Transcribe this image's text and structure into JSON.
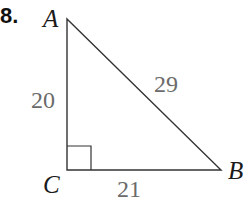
{
  "problem": {
    "number": "8."
  },
  "triangle": {
    "vertices": [
      {
        "label": "A",
        "x": 67,
        "y": 19
      },
      {
        "label": "B",
        "x": 221,
        "y": 170
      },
      {
        "label": "C",
        "x": 67,
        "y": 170
      }
    ],
    "sides": [
      {
        "between": "AC",
        "length_label": "20"
      },
      {
        "between": "AB",
        "length_label": "29"
      },
      {
        "between": "CB",
        "length_label": "21"
      }
    ],
    "right_angle_at": "C",
    "line_color": "#333333",
    "label_color": "#6b6b6b"
  }
}
